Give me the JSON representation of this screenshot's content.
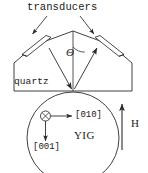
{
  "figure": {
    "kind": "schematic-diagram",
    "stroke_color": "#2b2b2b",
    "background_color": "#ffffff",
    "width": 148,
    "height": 173
  },
  "labels": {
    "transducers": "transducers",
    "theta": "Θ",
    "quartz": "quartz",
    "direction_010": "[010]",
    "direction_001": "[001]",
    "yig": "YIG",
    "field": "H"
  },
  "icons": {
    "into_page_symbol": "crossed-circle-icon",
    "leader_arrow_left": "leader-arrow-icon",
    "leader_arrow_right": "leader-arrow-icon",
    "beam_arrow_down_left": "beam-arrow-icon",
    "beam_arrow_up_right": "beam-arrow-icon",
    "axis_arrow_010": "axis-arrow-icon",
    "axis_arrow_001": "axis-arrow-icon",
    "field_arrow": "field-arrow-icon"
  },
  "geometry": {
    "apex": [
      73,
      91
    ],
    "wedge_peak": [
      73,
      31
    ],
    "quartz_block_left": 14,
    "quartz_block_right": 132,
    "quartz_block_bottom": 91,
    "sphere_center": [
      73,
      138
    ],
    "sphere_radius": 46,
    "theta_arc_radius": 16,
    "field_arrow_x": 122,
    "field_arrow_top": 103,
    "field_arrow_bottom": 150
  }
}
